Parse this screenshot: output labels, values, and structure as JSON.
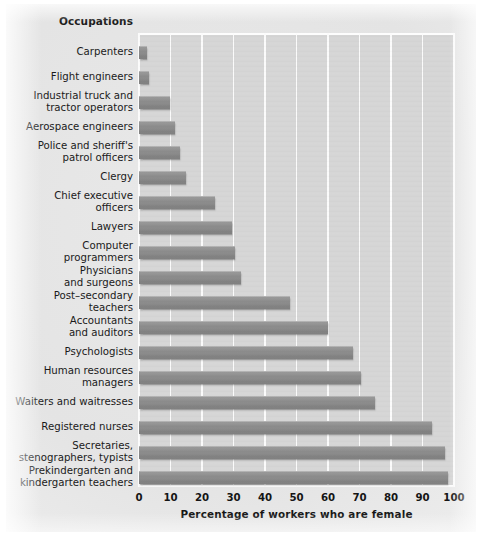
{
  "figure": {
    "occupations_header": "Occupations",
    "xaxis_title": "Percentage of workers who are female",
    "bar_color": "#8c8c8c",
    "plot_background": "#d6d6d6",
    "gridline_color": "#fbfbfb",
    "page_background": "#e8e8e8"
  },
  "chart_data": {
    "type": "bar",
    "orientation": "horizontal",
    "title": "",
    "xlabel": "Percentage of workers who are female",
    "ylabel": "Occupations",
    "xlim": [
      0,
      100
    ],
    "xticks": [
      0,
      10,
      20,
      30,
      40,
      50,
      60,
      70,
      80,
      90,
      100
    ],
    "grid": true,
    "legend": "none",
    "categories": [
      "Carpenters",
      "Flight engineers",
      "Industrial truck and tractor operators",
      "Aerospace engineers",
      "Police and sheriff's patrol officers",
      "Clergy",
      "Chief executive officers",
      "Lawyers",
      "Computer programmers",
      "Physicians and surgeons",
      "Post–secondary teachers",
      "Accountants and auditors",
      "Psychologists",
      "Human resources managers",
      "Waiters and waitresses",
      "Registered nurses",
      "Secretaries, stenographers, typists",
      "Prekindergarten and kindergarten teachers"
    ],
    "values": [
      2.6,
      3.2,
      9.7,
      11.5,
      13.0,
      15.0,
      24.0,
      29.5,
      30.5,
      32.5,
      48.0,
      60.0,
      68.0,
      70.5,
      75.0,
      93.0,
      97.0,
      98.0
    ]
  },
  "labels": [
    {
      "lines": [
        "Carpenters"
      ],
      "value": 2.6
    },
    {
      "lines": [
        "Flight engineers"
      ],
      "value": 3.2
    },
    {
      "lines": [
        "Industrial truck and",
        "tractor operators"
      ],
      "value": 9.7
    },
    {
      "lines": [
        "Aerospace engineers"
      ],
      "value": 11.5
    },
    {
      "lines": [
        "Police and sheriff's",
        "patrol officers"
      ],
      "value": 13.0
    },
    {
      "lines": [
        "Clergy"
      ],
      "value": 15.0
    },
    {
      "lines": [
        "Chief executive",
        "officers"
      ],
      "value": 24.0
    },
    {
      "lines": [
        "Lawyers"
      ],
      "value": 29.5
    },
    {
      "lines": [
        "Computer",
        "programmers"
      ],
      "value": 30.5
    },
    {
      "lines": [
        "Physicians",
        "and surgeons"
      ],
      "value": 32.5
    },
    {
      "lines": [
        "Post–secondary",
        "teachers"
      ],
      "value": 48.0
    },
    {
      "lines": [
        "Accountants",
        "and auditors"
      ],
      "value": 60.0
    },
    {
      "lines": [
        "Psychologists"
      ],
      "value": 68.0
    },
    {
      "lines": [
        "Human resources",
        "managers"
      ],
      "value": 70.5
    },
    {
      "lines": [
        "Waiters and waitresses"
      ],
      "value": 75.0
    },
    {
      "lines": [
        "Registered nurses"
      ],
      "value": 93.0
    },
    {
      "lines": [
        "Secretaries,",
        "stenographers, typists"
      ],
      "value": 97.0
    },
    {
      "lines": [
        "Prekindergarten and",
        "kindergarten teachers"
      ],
      "value": 98.0
    }
  ],
  "xticks": [
    "0",
    "10",
    "20",
    "30",
    "40",
    "50",
    "60",
    "70",
    "80",
    "90",
    "100"
  ]
}
